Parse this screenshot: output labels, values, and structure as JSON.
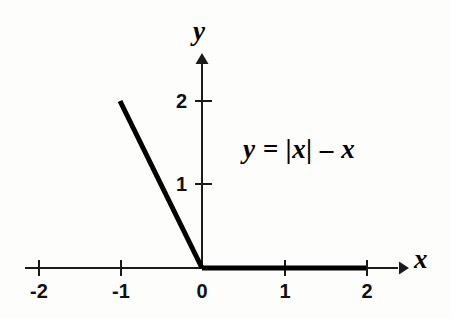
{
  "chart_data": {
    "type": "line",
    "title": "",
    "annotation": "y = |x| – x",
    "xlabel": "x",
    "ylabel": "y",
    "xlim": [
      -2.1,
      2.45
    ],
    "ylim": [
      -0.35,
      2.55
    ],
    "grid": false,
    "legend": null,
    "x_ticks": [
      -2,
      -1,
      0,
      1,
      2
    ],
    "x_tick_labels": [
      "-2",
      "-1",
      "0",
      "1",
      "2"
    ],
    "y_ticks": [
      1,
      2
    ],
    "y_tick_labels": [
      "1",
      "2"
    ],
    "series": [
      {
        "name": "y = |x| - x",
        "x": [
          -1,
          0,
          2
        ],
        "values": [
          2,
          0,
          0
        ],
        "color": "#000000",
        "linewidth": 5
      }
    ]
  },
  "axes": {
    "x_name": "x",
    "y_name": "y",
    "axis_color": "#1a1a1a"
  },
  "equation": {
    "text": "y = |x| – x"
  },
  "ticks": {
    "x": [
      {
        "label": "-2",
        "value": -2
      },
      {
        "label": "-1",
        "value": -1
      },
      {
        "label": "0",
        "value": 0
      },
      {
        "label": "1",
        "value": 1
      },
      {
        "label": "2",
        "value": 2
      }
    ],
    "y": [
      {
        "label": "1",
        "value": 1
      },
      {
        "label": "2",
        "value": 2
      }
    ]
  }
}
